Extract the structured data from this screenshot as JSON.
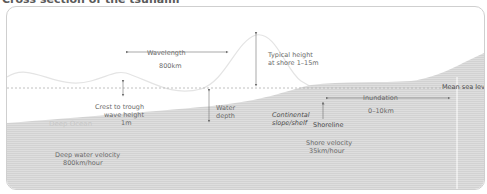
{
  "title": "Cross section of the tsunami",
  "labels": {
    "wavelength": "Wavelength",
    "wavelength_value": "800km",
    "typical_height_line1": "Typical height",
    "typical_height_line2": "at shore 1–15m",
    "mean_sea_level": "Mean sea level",
    "inundation": "Inundation",
    "inundation_value": "0–10km",
    "crest_line1": "Crest to trough",
    "crest_line2": "wave height",
    "crest_line3": "1m",
    "water_depth_line1": "Water",
    "water_depth_line2": "depth",
    "deep_ocean": "Deep Ocean",
    "continental_line1": "Continental",
    "continental_line2": "slope/shelf",
    "shoreline": "Shoreline",
    "deep_velocity_line1": "Deep water velocity",
    "deep_velocity_line2": "800km/hour",
    "shore_velocity_line1": "Shore velocity",
    "shore_velocity_line2": "35km/hour"
  },
  "colors": {
    "ground": "#d9d9d9",
    "wave_line": "#e6e6e6",
    "sea_level": "#b0b0b0",
    "arrow": "#707070",
    "text": "#6a6a6a"
  }
}
